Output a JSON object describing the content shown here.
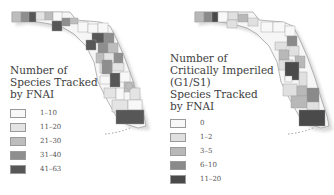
{
  "maps": [
    {
      "id": "species-tracked",
      "legend_title": "Number of\nSpecies Tracked\nby FNAI",
      "legend": [
        {
          "label": "1–10",
          "color": "#f8f8f8"
        },
        {
          "label": "11–20",
          "color": "#e4e4e4"
        },
        {
          "label": "21–30",
          "color": "#bdbdbd"
        },
        {
          "label": "31–40",
          "color": "#8e8e8e"
        },
        {
          "label": "41–63",
          "color": "#575757"
        }
      ]
    },
    {
      "id": "critically-imperiled",
      "legend_title": "Number of\nCritically Imperiled\n(G1/S1)\nSpecies Tracked\nby FNAI",
      "legend": [
        {
          "label": "0",
          "color": "#f8f8f8"
        },
        {
          "label": "1–2",
          "color": "#e0e0e0"
        },
        {
          "label": "3–5",
          "color": "#b8b8b8"
        },
        {
          "label": "6–10",
          "color": "#8a8a8a"
        },
        {
          "label": "11–20",
          "color": "#4a4a4a"
        }
      ]
    }
  ]
}
